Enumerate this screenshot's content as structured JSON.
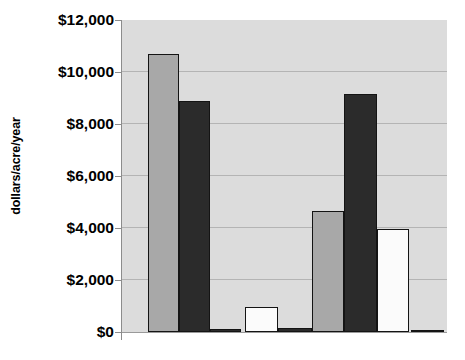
{
  "chart_data": {
    "type": "bar",
    "title": "",
    "subtitle": "",
    "xlabel": "",
    "ylabel": "dollars/acre/year",
    "ylim": [
      0,
      12000
    ],
    "yticks": [
      0,
      2000,
      4000,
      6000,
      8000,
      10000,
      12000
    ],
    "ytick_labels": [
      "$0",
      "$2,000",
      "$4,000",
      "$6,000",
      "$8,000",
      "$10,000",
      "$12,000"
    ],
    "xtick_labels": [
      "",
      "",
      "",
      "",
      "",
      "",
      "",
      "",
      ""
    ],
    "grid": "horizontal",
    "legend": "none",
    "plot_background": "#dcdcdc",
    "categories": [
      "1",
      "2",
      "3",
      "4",
      "5",
      "6",
      "7",
      "8",
      "9"
    ],
    "values": [
      10700,
      8900,
      100,
      950,
      150,
      4650,
      9150,
      3950,
      50
    ],
    "bar_colors": [
      "#a8a8a8",
      "#2b2b2b",
      "#2b2b2b",
      "#fbfbfb",
      "#2b2b2b",
      "#a8a8a8",
      "#2b2b2b",
      "#fbfbfb",
      "#2b2b2b"
    ],
    "bars": [
      {
        "index": 1,
        "value": 10700,
        "value_label": "$10,700",
        "fill": "#a8a8a8",
        "shade": "light-gray"
      },
      {
        "index": 2,
        "value": 8900,
        "value_label": "$8,900",
        "fill": "#2b2b2b",
        "shade": "dark"
      },
      {
        "index": 3,
        "value": 100,
        "value_label": "$100",
        "fill": "#2b2b2b",
        "shade": "dark"
      },
      {
        "index": 4,
        "value": 950,
        "value_label": "$950",
        "fill": "#fbfbfb",
        "shade": "white"
      },
      {
        "index": 5,
        "value": 150,
        "value_label": "$150",
        "fill": "#2b2b2b",
        "shade": "dark"
      },
      {
        "index": 6,
        "value": 4650,
        "value_label": "$4,650",
        "fill": "#a8a8a8",
        "shade": "light-gray"
      },
      {
        "index": 7,
        "value": 9150,
        "value_label": "$9,150",
        "fill": "#2b2b2b",
        "shade": "dark"
      },
      {
        "index": 8,
        "value": 3950,
        "value_label": "$3,950",
        "fill": "#fbfbfb",
        "shade": "white"
      },
      {
        "index": 9,
        "value": 50,
        "value_label": "$50",
        "fill": "#2b2b2b",
        "shade": "dark"
      }
    ]
  },
  "axis": {
    "y_title": "dollars/acre/year",
    "tick_12000": "$12,000",
    "tick_10000": "$10,000",
    "tick_8000": "$8,000",
    "tick_6000": "$6,000",
    "tick_4000": "$4,000",
    "tick_2000": "$2,000",
    "tick_0": "$0"
  },
  "colors": {
    "plot_bg": "#dcdcdc",
    "gridline": "#b4b4b4",
    "axis_line": "#8c8c8c",
    "bar_outline": "#141414",
    "bar_light": "#a8a8a8",
    "bar_dark": "#2b2b2b",
    "bar_white": "#fbfbfb",
    "text": "#000000"
  }
}
